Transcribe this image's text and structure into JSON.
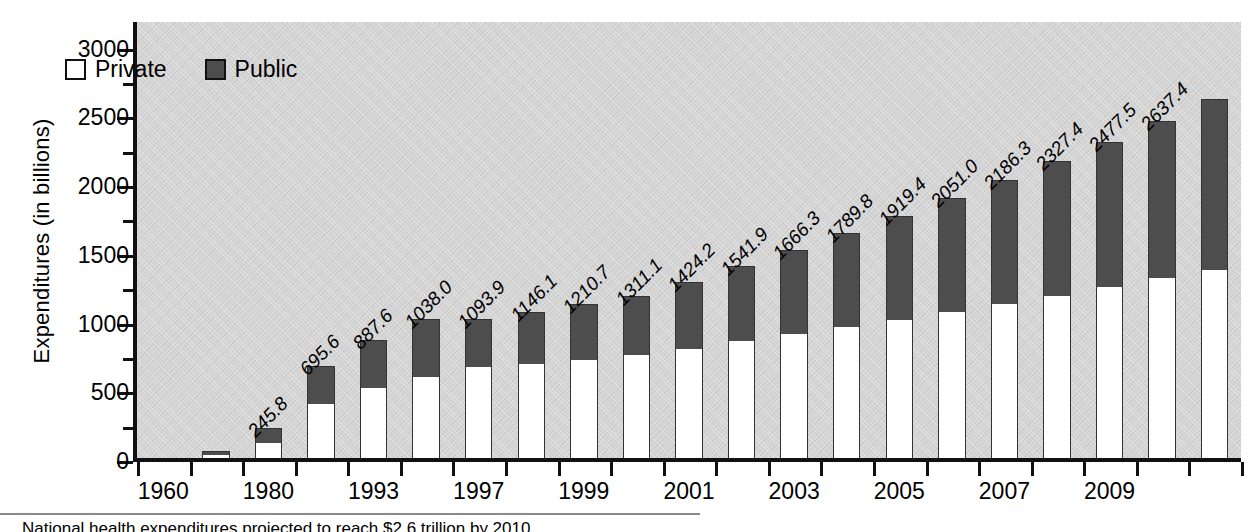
{
  "figure": {
    "ylabel": "Expenditures (in billions)",
    "caption": "National health expenditures projected to reach $2.6 trillion by 2010"
  },
  "legend": {
    "items": [
      {
        "label": "Private",
        "color": "#ffffff"
      },
      {
        "label": "Public",
        "color": "#4d4d4d"
      }
    ]
  },
  "chart_data": {
    "type": "bar",
    "title": "",
    "xlabel": "",
    "ylabel": "Expenditures (in billions)",
    "ylim": [
      0,
      3200
    ],
    "yticks": [
      0,
      500,
      1000,
      1500,
      2000,
      2500,
      3000
    ],
    "ytick_labels": [
      "0",
      "500",
      "1000",
      "1500",
      "2000",
      "2500",
      "3000"
    ],
    "yminor_ticks": [
      250,
      750,
      1250,
      1750,
      2250,
      2750
    ],
    "grid": false,
    "stacked": true,
    "legend_position": "upper-left-inside",
    "categories": [
      "1960",
      "1970",
      "1980",
      "1990",
      "1993",
      "1995",
      "1997",
      "1998",
      "1999",
      "2000",
      "2001",
      "2002",
      "2003",
      "2004",
      "2005",
      "2006",
      "2007",
      "2008",
      "2009",
      "2010",
      "2011"
    ],
    "xtick_labels": [
      "1960",
      "",
      "1980",
      "",
      "1993",
      "",
      "1997",
      "",
      "1999",
      "",
      "2001",
      "",
      "2003",
      "",
      "2005",
      "",
      "2007",
      "",
      "2009",
      "",
      ""
    ],
    "series": [
      {
        "name": "Private",
        "values": [
          20.3,
          54.0,
          140.2,
          420.0,
          541.0,
          620.0,
          690.0,
          712.0,
          740.0,
          780.0,
          820.0,
          880.0,
          930.0,
          980.0,
          1030.0,
          1090.0,
          1150.0,
          1210.0,
          1270.0,
          1340.0,
          1400.0
        ]
      },
      {
        "name": "Public",
        "values": [
          6.6,
          29.0,
          105.6,
          275.6,
          346.6,
          418.0,
          348.0,
          381.9,
          406.1,
          430.7,
          491.1,
          544.2,
          611.9,
          686.3,
          759.8,
          829.4,
          901.0,
          976.3,
          1057.4,
          1137.5,
          1237.4
        ]
      }
    ],
    "totals": [
      26.9,
      83.0,
      245.8,
      695.6,
      887.6,
      1038.0,
      1093.9,
      1146.1,
      1210.7,
      1311.1,
      1424.2,
      1541.9,
      1666.3,
      1789.8,
      1919.4,
      2051.0,
      2186.3,
      2327.4,
      2477.5,
      2637.4,
      2637.4
    ],
    "data_labels": [
      "",
      "",
      "245.8",
      "695.6",
      "887.6",
      "1038.0",
      "1093.9",
      "1146.1",
      "1210.7",
      "1311.1",
      "1424.2",
      "1541.9",
      "1666.3",
      "1789.8",
      "1919.4",
      "2051.0",
      "2186.3",
      "2327.4",
      "2477.5",
      "2637.4",
      ""
    ]
  }
}
